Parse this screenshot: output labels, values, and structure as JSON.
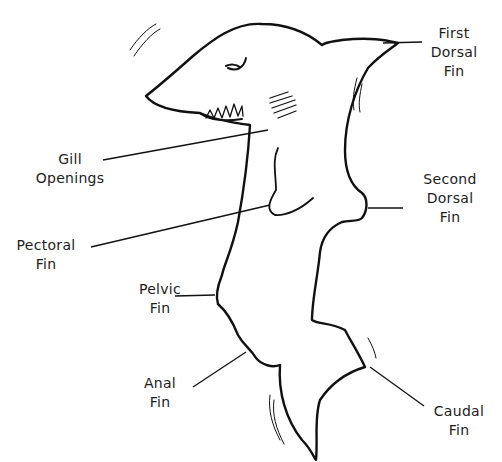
{
  "diagram": {
    "labels": {
      "first_dorsal": [
        "First",
        "Dorsal",
        "Fin"
      ],
      "gill": [
        "Gill",
        "Openings"
      ],
      "second_dorsal": [
        "Second",
        "Dorsal",
        "Fin"
      ],
      "pectoral": [
        "Pectoral",
        "Fin"
      ],
      "pelvic": [
        "Pelvic",
        "Fin"
      ],
      "anal": [
        "Anal",
        "Fin"
      ],
      "caudal": [
        "Caudal",
        "Fin"
      ]
    },
    "colors": {
      "ink": "#111111",
      "background": "#ffffff"
    }
  }
}
